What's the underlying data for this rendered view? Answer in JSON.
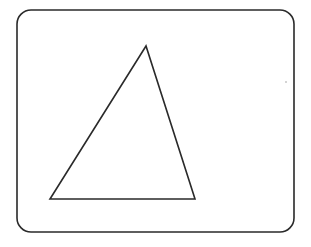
{
  "diagram": {
    "background": "#ffffff",
    "stroke_color": "#2a2a2a",
    "frame": {
      "shape": "rounded-rectangle",
      "x": 17,
      "y": 10,
      "width": 277,
      "height": 222,
      "corner_radius": 14,
      "stroke_width": 1.6
    },
    "triangle": {
      "shape": "triangle",
      "vertices": [
        {
          "label": "apex",
          "x": 146,
          "y": 46
        },
        {
          "label": "bottom-left",
          "x": 50,
          "y": 199
        },
        {
          "label": "bottom-right",
          "x": 195,
          "y": 199
        }
      ],
      "stroke_width": 1.6
    },
    "speck": {
      "x": 286,
      "y": 82,
      "r": 0.7
    }
  }
}
